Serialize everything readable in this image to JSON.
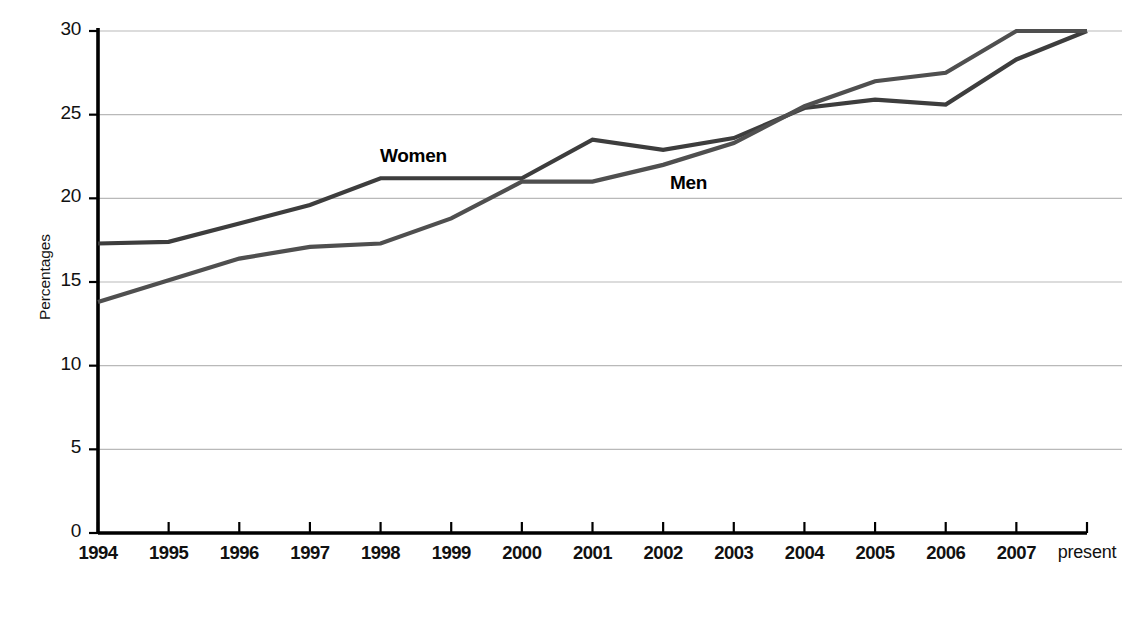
{
  "chart_data": {
    "type": "line",
    "title": "",
    "subtitle": "",
    "xlabel": "",
    "ylabel": "Percentages",
    "categories": [
      "1994",
      "1995",
      "1996",
      "1997",
      "1998",
      "1999",
      "2000",
      "2001",
      "2002",
      "2003",
      "2004",
      "2005",
      "2006",
      "2007",
      "present"
    ],
    "xtick_labels": [
      "1994",
      "1995",
      "1996",
      "1997",
      "1998",
      "1999",
      "2000",
      "2001",
      "2002",
      "2003",
      "2004",
      "2005",
      "2006",
      "2007",
      "present"
    ],
    "ytick_labels": [
      "0",
      "5",
      "10",
      "15",
      "20",
      "25",
      "30"
    ],
    "yticks": [
      0,
      5,
      10,
      15,
      20,
      25,
      30
    ],
    "ylim": [
      0,
      30
    ],
    "grid": "horizontal",
    "legend_position": "inline-annotation",
    "series": [
      {
        "name": "Women",
        "color": "#3d3d3d",
        "label_x_category": "1998",
        "values": [
          17.3,
          17.4,
          18.5,
          19.6,
          21.2,
          21.2,
          21.2,
          23.5,
          22.9,
          23.6,
          25.4,
          25.9,
          25.6,
          28.3,
          30.0
        ]
      },
      {
        "name": "Men",
        "color": "#4f4f4f",
        "label_x_category": "2002",
        "values": [
          13.8,
          15.1,
          16.4,
          17.1,
          17.3,
          18.8,
          21.0,
          21.0,
          22.0,
          23.3,
          25.5,
          27.0,
          27.5,
          30.0,
          30.0
        ]
      }
    ],
    "annotations": [
      {
        "text": "Women",
        "x_px": 380,
        "y_px": 145
      },
      {
        "text": "Men",
        "x_px": 670,
        "y_px": 172
      }
    ]
  },
  "axes": {
    "axis_color": "#000000",
    "grid_color": "#b9b9b9",
    "y_title": "Percentages"
  }
}
